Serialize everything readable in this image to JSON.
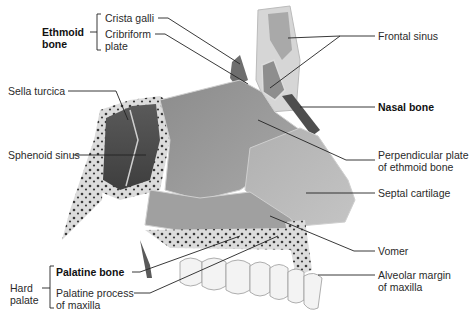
{
  "figure": {
    "palette": {
      "background": "#ffffff",
      "bone_dark": "#5a5a5a",
      "bone_mid": "#9a9a9a",
      "cartilage": "#b8b8b8",
      "spongy": "#d9d9d9",
      "teeth": "#f2f2f2",
      "leader": "#222222"
    }
  },
  "labels": {
    "ethmoid_group": "Ethmoid",
    "ethmoid_group_line2": "bone",
    "crista_galli": "Crista galli",
    "cribriform_line1": "Cribriform",
    "cribriform_line2": "plate",
    "frontal_sinus": "Frontal sinus",
    "sella_turcica": "Sella turcica",
    "nasal_bone": "Nasal bone",
    "sphenoid_sinus": "Sphenoid sinus",
    "perpendicular_line1": "Perpendicular plate",
    "perpendicular_line2": "of ethmoid bone",
    "septal_cartilage": "Septal cartilage",
    "vomer": "Vomer",
    "alveolar_line1": "Alveolar margin",
    "alveolar_line2": "of maxilla",
    "palatine_bone": "Palatine bone",
    "hard_palate_line1": "Hard",
    "hard_palate_line2": "palate",
    "palatine_process_line1": "Palatine process",
    "palatine_process_line2": "of maxilla"
  }
}
